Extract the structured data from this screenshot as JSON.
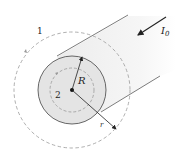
{
  "figure": {
    "labels": {
      "loop_outer": "1",
      "loop_inner": "2",
      "radius_cylinder": "R",
      "radius_loop": "r",
      "current": "I",
      "current_subscript": "0"
    },
    "colors": {
      "line": "#333333",
      "dashed": "#9a9a9a",
      "face_fill": "#e6e6e6",
      "body_fill": "#f2f2f2",
      "background": "#ffffff"
    }
  }
}
